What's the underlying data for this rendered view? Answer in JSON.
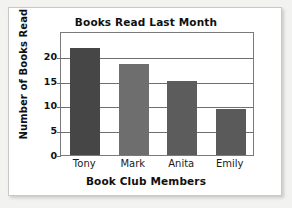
{
  "chart_data": {
    "type": "bar",
    "title": "Books Read Last Month",
    "xlabel": "Book Club Members",
    "ylabel": "Number of Books Read",
    "categories": [
      "Tony",
      "Mark",
      "Anita",
      "Emily"
    ],
    "values": [
      21.5,
      18.3,
      15,
      9.2
    ],
    "bar_colors": [
      "#464646",
      "#6e6e6e",
      "#5c5c5c",
      "#5a5a5a"
    ],
    "ylim": [
      0,
      25
    ],
    "yticks": [
      0,
      5,
      10,
      15,
      20
    ],
    "ytick_labels": [
      "0",
      "5",
      "10",
      "15",
      "20"
    ],
    "grid": true,
    "legend": null
  },
  "figure": {
    "background_color": "#ffffff",
    "border_color": "#c9c9c9",
    "axis_color": "#6f6f6f"
  }
}
